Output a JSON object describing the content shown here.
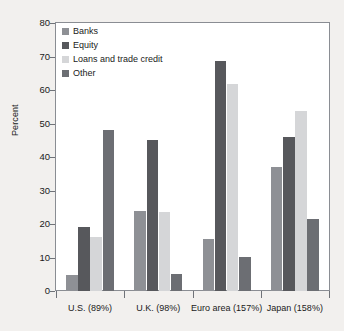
{
  "chart_data": {
    "type": "bar",
    "title": "",
    "subtitle": "",
    "xlabel": "",
    "ylabel": "Percent",
    "ylim": [
      0,
      80
    ],
    "ytick_labels": [
      "80",
      "70",
      "60",
      "50",
      "40",
      "30",
      "20",
      "10",
      "0"
    ],
    "ytick_values": [
      80,
      70,
      60,
      50,
      40,
      30,
      20,
      10,
      0
    ],
    "grid": false,
    "legend_position": "top-left",
    "categories": [
      "U.S. (89%)",
      "U.K. (98%)",
      "Euro area (157%)",
      "Japan (158%)"
    ],
    "series": [
      {
        "name": "Banks",
        "color": "#8e9095",
        "values": [
          4.8,
          24.0,
          15.4,
          37.1
        ]
      },
      {
        "name": "Equity",
        "color": "#57585c",
        "values": [
          19.2,
          45.1,
          68.8,
          46.0
        ]
      },
      {
        "name": "Loans and trade credit",
        "color": "#d5d6d8",
        "values": [
          16.1,
          23.7,
          61.9,
          53.7
        ]
      },
      {
        "name": "Other",
        "color": "#6c6e73",
        "values": [
          48.0,
          5.2,
          10.2,
          21.5
        ]
      }
    ]
  },
  "figure": {
    "background_color": "#f2f0ee",
    "plot_background_color": "#ffffff",
    "axis_color": "#8a8d93"
  }
}
